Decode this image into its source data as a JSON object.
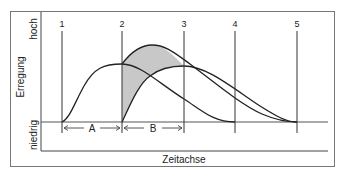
{
  "diagram": {
    "y_axis": {
      "title": "Erregung",
      "high_label": "hoch",
      "low_label": "niedrig"
    },
    "x_axis": {
      "title": "Zeitachse"
    },
    "markers": [
      {
        "label": "1"
      },
      {
        "label": "2"
      },
      {
        "label": "3"
      },
      {
        "label": "4"
      },
      {
        "label": "5"
      }
    ],
    "intervals": [
      {
        "label": "A",
        "from": "1",
        "to": "2"
      },
      {
        "label": "B",
        "from": "2",
        "to": "3"
      }
    ],
    "colors": {
      "line": "#222222",
      "shade": "#c8c8c8",
      "frame": "#777777"
    }
  }
}
